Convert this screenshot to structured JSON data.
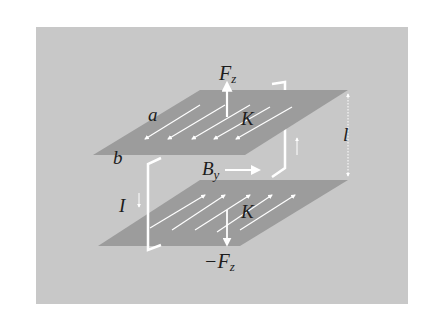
{
  "figure": {
    "colors": {
      "page_background": "#ffffff",
      "panel_background": "#c8c8c8",
      "plate_fill": "#9c9c9c",
      "arrow_color": "#ffffff",
      "text_color": "#1c1c1c"
    },
    "labels": {
      "force_top": "F",
      "force_top_sub": "z",
      "force_bottom_sign": "−F",
      "force_bottom_sub": "z",
      "field": "B",
      "field_sub": "y",
      "surface_current_top": "K",
      "surface_current_bottom": "K",
      "plate_dim_a": "a",
      "plate_dim_b": "b",
      "current": "I",
      "separation": "l"
    }
  }
}
